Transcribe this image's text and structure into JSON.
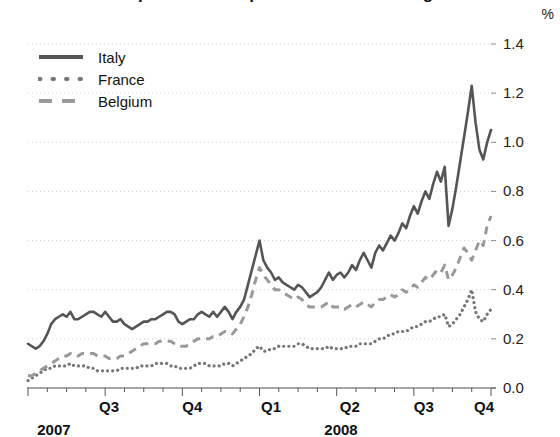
{
  "chart_data": {
    "type": "line",
    "title": "Spreads on corporate bonds widening",
    "unit_label": "%",
    "xlabel": "",
    "ylabel": "",
    "ylim": [
      0.0,
      1.4
    ],
    "yticks": [
      "0.0",
      "0.2",
      "0.4",
      "0.6",
      "0.8",
      "1.0",
      "1.2",
      "1.4"
    ],
    "ytick_values": [
      0.0,
      0.2,
      0.4,
      0.6,
      0.8,
      1.0,
      1.2,
      1.4
    ],
    "xticks": [
      "Q3",
      "Q4",
      "Q1",
      "Q2",
      "Q3",
      "Q4"
    ],
    "xtick_positions": [
      0.175,
      0.355,
      0.525,
      0.695,
      0.855,
      0.985
    ],
    "year_labels": [
      {
        "text": "2007",
        "position": 0.02
      },
      {
        "text": "2008",
        "position": 0.64
      }
    ],
    "grid": "horizontal-dotted",
    "legend_position": "top-left",
    "series": [
      {
        "name": "Italy",
        "style": "solid",
        "color": "#555555",
        "values": [
          0.18,
          0.17,
          0.16,
          0.17,
          0.19,
          0.22,
          0.26,
          0.28,
          0.29,
          0.3,
          0.29,
          0.31,
          0.28,
          0.28,
          0.29,
          0.3,
          0.31,
          0.31,
          0.3,
          0.29,
          0.31,
          0.29,
          0.27,
          0.27,
          0.28,
          0.26,
          0.25,
          0.24,
          0.25,
          0.26,
          0.27,
          0.27,
          0.28,
          0.28,
          0.29,
          0.3,
          0.31,
          0.31,
          0.3,
          0.27,
          0.26,
          0.27,
          0.28,
          0.28,
          0.3,
          0.31,
          0.3,
          0.29,
          0.31,
          0.29,
          0.31,
          0.33,
          0.31,
          0.28,
          0.31,
          0.33,
          0.36,
          0.42,
          0.48,
          0.54,
          0.6,
          0.52,
          0.49,
          0.47,
          0.44,
          0.45,
          0.43,
          0.42,
          0.41,
          0.4,
          0.42,
          0.41,
          0.39,
          0.37,
          0.38,
          0.39,
          0.41,
          0.44,
          0.47,
          0.44,
          0.46,
          0.47,
          0.45,
          0.47,
          0.5,
          0.48,
          0.52,
          0.55,
          0.52,
          0.49,
          0.55,
          0.58,
          0.56,
          0.59,
          0.62,
          0.6,
          0.63,
          0.67,
          0.65,
          0.7,
          0.74,
          0.71,
          0.76,
          0.8,
          0.77,
          0.83,
          0.88,
          0.84,
          0.9,
          0.66,
          0.73,
          0.82,
          0.92,
          1.02,
          1.12,
          1.23,
          1.08,
          0.97,
          0.93,
          1.0,
          1.05
        ]
      },
      {
        "name": "France",
        "style": "dotted",
        "color": "#777777",
        "values": [
          0.03,
          0.04,
          0.05,
          0.06,
          0.07,
          0.08,
          0.08,
          0.09,
          0.09,
          0.09,
          0.09,
          0.1,
          0.09,
          0.09,
          0.09,
          0.09,
          0.08,
          0.08,
          0.07,
          0.07,
          0.07,
          0.07,
          0.07,
          0.07,
          0.08,
          0.08,
          0.08,
          0.08,
          0.08,
          0.09,
          0.09,
          0.09,
          0.09,
          0.1,
          0.1,
          0.1,
          0.1,
          0.09,
          0.09,
          0.08,
          0.08,
          0.08,
          0.08,
          0.09,
          0.1,
          0.1,
          0.1,
          0.09,
          0.09,
          0.09,
          0.09,
          0.1,
          0.1,
          0.09,
          0.1,
          0.11,
          0.12,
          0.13,
          0.14,
          0.16,
          0.17,
          0.15,
          0.15,
          0.16,
          0.16,
          0.17,
          0.17,
          0.17,
          0.17,
          0.17,
          0.18,
          0.18,
          0.17,
          0.16,
          0.16,
          0.16,
          0.16,
          0.16,
          0.17,
          0.16,
          0.16,
          0.16,
          0.16,
          0.17,
          0.17,
          0.17,
          0.18,
          0.18,
          0.18,
          0.18,
          0.19,
          0.2,
          0.2,
          0.21,
          0.22,
          0.22,
          0.23,
          0.23,
          0.23,
          0.24,
          0.25,
          0.25,
          0.26,
          0.27,
          0.27,
          0.28,
          0.29,
          0.29,
          0.3,
          0.25,
          0.26,
          0.28,
          0.3,
          0.33,
          0.36,
          0.4,
          0.31,
          0.28,
          0.27,
          0.3,
          0.32
        ]
      },
      {
        "name": "Belgium",
        "style": "dashed",
        "color": "#999999",
        "values": [
          0.05,
          0.05,
          0.06,
          0.07,
          0.08,
          0.09,
          0.1,
          0.11,
          0.12,
          0.13,
          0.13,
          0.14,
          0.13,
          0.13,
          0.14,
          0.14,
          0.14,
          0.14,
          0.13,
          0.13,
          0.13,
          0.12,
          0.12,
          0.12,
          0.13,
          0.13,
          0.14,
          0.15,
          0.16,
          0.17,
          0.18,
          0.18,
          0.18,
          0.18,
          0.19,
          0.19,
          0.19,
          0.19,
          0.18,
          0.17,
          0.17,
          0.17,
          0.18,
          0.19,
          0.2,
          0.2,
          0.2,
          0.2,
          0.21,
          0.21,
          0.22,
          0.23,
          0.23,
          0.22,
          0.24,
          0.26,
          0.29,
          0.33,
          0.38,
          0.44,
          0.49,
          0.46,
          0.44,
          0.42,
          0.4,
          0.4,
          0.39,
          0.38,
          0.37,
          0.36,
          0.37,
          0.36,
          0.34,
          0.33,
          0.33,
          0.33,
          0.33,
          0.34,
          0.35,
          0.33,
          0.33,
          0.33,
          0.32,
          0.33,
          0.34,
          0.33,
          0.34,
          0.35,
          0.34,
          0.33,
          0.35,
          0.36,
          0.36,
          0.37,
          0.38,
          0.37,
          0.38,
          0.4,
          0.39,
          0.4,
          0.42,
          0.41,
          0.43,
          0.45,
          0.44,
          0.46,
          0.48,
          0.47,
          0.5,
          0.44,
          0.46,
          0.49,
          0.53,
          0.57,
          0.55,
          0.52,
          0.56,
          0.6,
          0.58,
          0.66,
          0.7
        ]
      }
    ]
  },
  "legend": {
    "items": [
      {
        "label": "Italy"
      },
      {
        "label": "France"
      },
      {
        "label": "Belgium"
      }
    ]
  }
}
